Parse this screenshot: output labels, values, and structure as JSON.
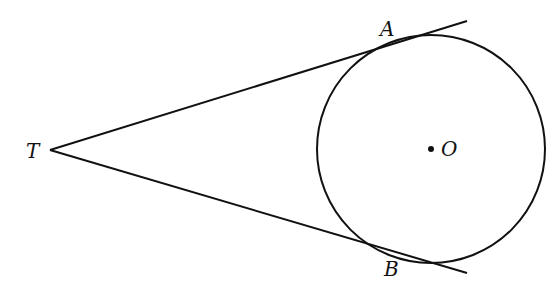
{
  "diagram": {
    "labels": {
      "T": "T",
      "A": "A",
      "B": "B",
      "O": "O"
    },
    "points": {
      "T": [
        50,
        150
      ],
      "A": [
        408,
        40
      ],
      "B": [
        408,
        258
      ],
      "O": [
        431,
        149
      ]
    },
    "circle": {
      "cx": 431,
      "cy": 149,
      "r": 114
    },
    "stroke_color": "#111111"
  }
}
